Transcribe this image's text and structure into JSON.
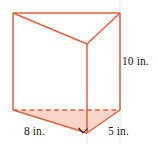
{
  "figure": {
    "name": "triangular-prism",
    "colors": {
      "edge": "#E0603C",
      "edge_light": "#E8907A",
      "fill_top": "#FFFFFF",
      "fill_base": "#F7D5C8",
      "hidden_edge": "#E0603C",
      "guide": "#C9D4E8",
      "right_angle": "#1A1A1A",
      "text": "#1A1A1A"
    },
    "labels": {
      "height": "10 in.",
      "depth": "8 in.",
      "width": "5 in."
    },
    "vertices": {
      "top_back_left": [
        13,
        13
      ],
      "top_back_right": [
        120,
        13
      ],
      "top_front": [
        87,
        44
      ],
      "bottom_back_left": [
        13,
        110
      ],
      "bottom_back_right": [
        120,
        110
      ],
      "bottom_front": [
        87,
        133
      ]
    },
    "markers": {
      "right_angle_at": "bottom_front",
      "hidden_edge": "bottom_back_left to bottom_back_right"
    }
  }
}
